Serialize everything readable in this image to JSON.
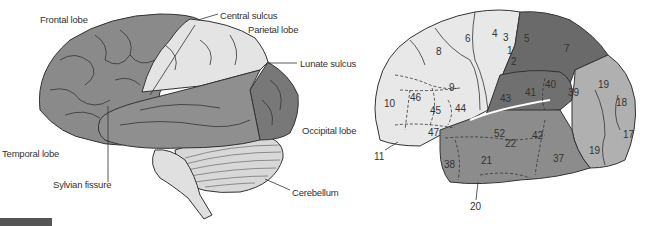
{
  "left_figure": {
    "title": "Lateral view of brain lobes",
    "labels": {
      "frontal_lobe": "Frontal lobe",
      "central_sulcus": "Central sulcus",
      "parietal_lobe": "Parietal lobe",
      "lunate_sulcus": "Lunate sulcus",
      "occipital_lobe": "Occipital lobe",
      "temporal_lobe": "Temporal lobe",
      "sylvian_fissure": "Sylvian fissure",
      "cerebellum": "Cerebellum"
    }
  },
  "right_figure": {
    "title": "Brodmann areas (lateral view)",
    "areas": {
      "a4": "4",
      "a6": "6",
      "a8": "8",
      "a3": "3",
      "a1": "1",
      "a2": "2",
      "a5": "5",
      "a7": "7",
      "a9": "9",
      "a10": "10",
      "a46": "46",
      "a45": "45",
      "a44": "44",
      "a47": "47",
      "a11": "11",
      "a43": "43",
      "a41": "41",
      "a40": "40",
      "a39": "39",
      "a19a": "19",
      "a18": "18",
      "a17": "17",
      "a19b": "19",
      "a52": "52",
      "a42": "42",
      "a22": "22",
      "a21": "21",
      "a38": "38",
      "a37": "37",
      "a20": "20"
    }
  },
  "colors": {
    "frontal": "#8a8a8a",
    "parietal_light": "#e6e6e6",
    "occipital": "#7a7a7a",
    "temporal": "#8f8f8f",
    "area_light": "#e8e8e8",
    "area_dark": "#6a6a6a",
    "area_mid": "#8c8c8c",
    "area_occipital": "#b0b0b0",
    "outline": "#333333"
  }
}
